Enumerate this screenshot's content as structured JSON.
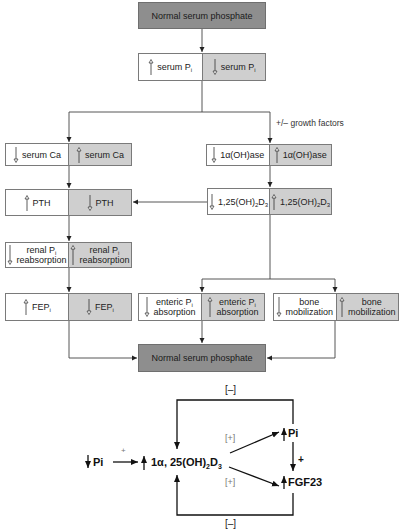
{
  "top_box": {
    "label": "Normal serum phosphate"
  },
  "serum_pi": {
    "left": {
      "arrow": "up",
      "text": "serum P",
      "sub": "i"
    },
    "right": {
      "arrow": "down",
      "text": "serum P",
      "sub": "i"
    }
  },
  "growth_note": "+/– growth factors",
  "serum_ca": {
    "left": {
      "arrow": "down",
      "text": "serum Ca"
    },
    "right": {
      "arrow": "up",
      "text": "serum Ca"
    }
  },
  "hydroxylase": {
    "left": {
      "arrow": "down",
      "text": "1α(OH)ase"
    },
    "right": {
      "arrow": "up",
      "text": "1α(OH)ase"
    }
  },
  "pth": {
    "left": {
      "arrow": "up",
      "text": "PTH"
    },
    "right": {
      "arrow": "down",
      "text": "PTH"
    }
  },
  "vitd": {
    "left": {
      "arrow": "down",
      "a": "1,25(OH)",
      "s1": "2",
      "b": "D",
      "s2": "3"
    },
    "right": {
      "arrow": "up",
      "a": "1,25(OH)",
      "s1": "2",
      "b": "D",
      "s2": "3"
    }
  },
  "renal": {
    "left": {
      "arrow": "down",
      "line1": "renal P",
      "sub": "i",
      "line2": "reabsorption"
    },
    "right": {
      "arrow": "up",
      "line1": "renal P",
      "sub": "i",
      "line2": "reabsorption"
    }
  },
  "fep": {
    "left": {
      "arrow": "up",
      "text": "FEP",
      "sub": "i"
    },
    "right": {
      "arrow": "down",
      "text": "FEP",
      "sub": "i"
    }
  },
  "enteric": {
    "left": {
      "arrow": "down",
      "line1": "enteric P",
      "sub": "i",
      "line2": "absorption"
    },
    "right": {
      "arrow": "up",
      "line1": "enteric P",
      "sub": "i",
      "line2": "absorption"
    }
  },
  "bone": {
    "left": {
      "arrow": "down",
      "line1": "bone",
      "line2": "mobilization"
    },
    "right": {
      "arrow": "up",
      "line1": "bone",
      "line2": "mobilization"
    }
  },
  "bottom_box": {
    "label": "Normal serum phosphate"
  },
  "feedback": {
    "top_label": "[–]",
    "bottom_label": "[–]",
    "upper_plus": "[+]",
    "lower_plus": "[+]",
    "input_label": "Pi",
    "input_plus": "+",
    "center": {
      "a": "1α, 25(OH)",
      "s1": "2",
      "b": "D",
      "s2": "3"
    },
    "pi_label": "Pi",
    "pi_to_fgf_plus": "+",
    "fgf_label": "FGF23"
  },
  "colors": {
    "dark_box": "#8e8e8e",
    "shaded_half": "#cfcfcf",
    "line": "#333333"
  }
}
